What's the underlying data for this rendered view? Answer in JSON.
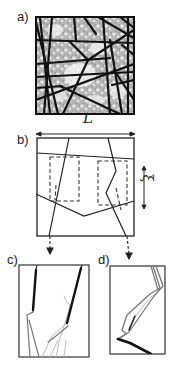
{
  "figure": {
    "panels": [
      {
        "id": "a",
        "label": "a)",
        "description": "Fracture network over heterogeneous (grey/white) porous medium"
      },
      {
        "id": "b",
        "label": "b)",
        "description": "Schematic of domain of size L with fractures and dashed sampling windows of size xi"
      },
      {
        "id": "c",
        "label": "c)",
        "description": "Zoom on left dashed window showing fracture traces"
      },
      {
        "id": "d",
        "label": "d)",
        "description": "Zoom on right dashed window showing kinked fracture traces"
      }
    ],
    "dimension_labels": {
      "L_top": "L",
      "L_b": "L",
      "xi": "ξ"
    }
  },
  "colors": {
    "line": "#111111",
    "frame": "#333333",
    "grey_fill": "#a8a8a8",
    "light_grey": "#bdbdbd",
    "mid_grey": "#777777"
  }
}
